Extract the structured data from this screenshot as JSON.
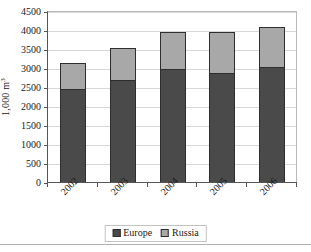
{
  "chart_data": {
    "type": "bar",
    "subtype": "stacked-column",
    "title": "",
    "xlabel": "",
    "ylabel": "1,000 m³",
    "categories": [
      "2002",
      "2003",
      "2004",
      "2005",
      "2006"
    ],
    "series": [
      {
        "name": "Europe",
        "color": "#4a4a4a",
        "values": [
          2470,
          2720,
          2990,
          2900,
          3060
        ]
      },
      {
        "name": "Russia",
        "color": "#a8a8a8",
        "values": [
          680,
          830,
          980,
          1070,
          1050
        ]
      }
    ],
    "totals": [
      3150,
      3550,
      3970,
      3970,
      4110
    ],
    "ylim": [
      0,
      4500
    ],
    "ytick_step": 500,
    "yticks": [
      0,
      500,
      1000,
      1500,
      2000,
      2500,
      3000,
      3500,
      4000,
      4500
    ],
    "ytick_labels": [
      "0",
      "500",
      "1000",
      "1500",
      "2000",
      "2500",
      "3000",
      "3500",
      "4000",
      "4500"
    ],
    "grid": true,
    "grid_axis": "y",
    "legend_position": "bottom",
    "legend_entries": [
      "Europe",
      "Russia"
    ],
    "xtick_label_rotation": -45
  },
  "colors": {
    "europe": "#4a4a4a",
    "russia": "#a8a8a8",
    "axis": "#555555",
    "gridline": "#d8d8d8",
    "bar_outline": "#2e2e2e",
    "text": "#1a1a1a",
    "background": "#ffffff"
  }
}
